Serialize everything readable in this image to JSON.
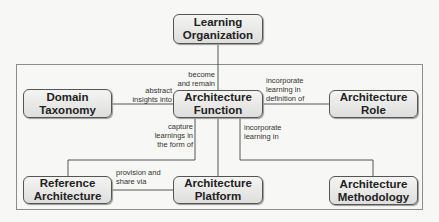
{
  "diagram": {
    "nodes": {
      "learning_org": {
        "line1": "Learning",
        "line2": "Organization"
      },
      "domain_taxonomy": {
        "line1": "Domain",
        "line2": "Taxonomy"
      },
      "arch_function": {
        "line1": "Architecture",
        "line2": "Function"
      },
      "arch_role": {
        "line1": "Architecture",
        "line2": "Role"
      },
      "reference_arch": {
        "line1": "Reference",
        "line2": "Architecture"
      },
      "arch_platform": {
        "line1": "Architecture",
        "line2": "Platform"
      },
      "arch_methodology": {
        "line1": "Architecture",
        "line2": "Methodology"
      }
    },
    "edges": {
      "function_to_learning_org": "become\nand remain",
      "function_to_domain_taxonomy": "abstract\ninsights into",
      "function_to_role": "incorporate\nlearning in\ndefinition of",
      "function_to_reference": "capture\nlearnings in\nthe form of",
      "function_to_methodology": "incorporate\nlearning in",
      "reference_to_platform": "provision and\nshare via"
    }
  }
}
